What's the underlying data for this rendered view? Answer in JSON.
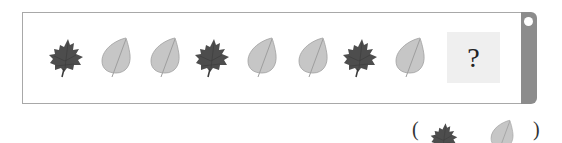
{
  "sequence": {
    "items": [
      {
        "type": "maple-leaf-dark"
      },
      {
        "type": "round-leaf-light"
      },
      {
        "type": "round-leaf-light"
      },
      {
        "type": "maple-leaf-dark"
      },
      {
        "type": "round-leaf-light"
      },
      {
        "type": "round-leaf-light"
      },
      {
        "type": "maple-leaf-dark"
      },
      {
        "type": "round-leaf-light"
      }
    ],
    "question_mark": "?"
  },
  "answer": {
    "open_paren": "(",
    "close_paren": ")",
    "options": [
      {
        "type": "maple-leaf-dark"
      },
      {
        "type": "round-leaf-light"
      }
    ]
  },
  "colors": {
    "dark_leaf": "#4a4a4a",
    "light_leaf": "#c4c4c4",
    "frame_border": "#a8a8a8",
    "side_bar": "#8c8c8c",
    "question_box": "#efefef"
  }
}
